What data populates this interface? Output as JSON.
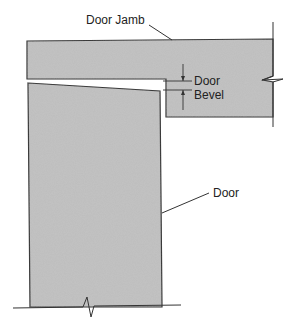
{
  "diagram": {
    "labels": {
      "door_jamb": "Door Jamb",
      "door_bevel_line1": "Door",
      "door_bevel_line2": "Bevel",
      "door": "Door"
    },
    "colors": {
      "fill": "#bdbdbd",
      "stroke": "#333333",
      "background": "#ffffff"
    }
  }
}
